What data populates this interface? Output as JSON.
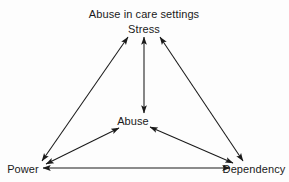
{
  "diagram": {
    "title": "Abuse in care settings",
    "type": "node-link-diagram",
    "background_color": "#fdfdfd",
    "line_color": "#1a1a1a",
    "text_color": "#1a1a1a",
    "nodes": [
      {
        "id": "stress",
        "label": "Stress",
        "x": 144,
        "y": 29,
        "role": "top-vertex"
      },
      {
        "id": "abuse",
        "label": "Abuse",
        "x": 133,
        "y": 121,
        "role": "center"
      },
      {
        "id": "power",
        "label": "Power",
        "x": 23,
        "y": 169,
        "role": "bottom-left-vertex"
      },
      {
        "id": "dependency",
        "label": "Dependency",
        "x": 254,
        "y": 169,
        "role": "bottom-right-vertex"
      }
    ],
    "edges": [
      {
        "id": "power-stress",
        "from": "power",
        "to": "stress",
        "arrows": "both"
      },
      {
        "id": "stress-dependency",
        "from": "stress",
        "to": "dependency",
        "arrows": "both"
      },
      {
        "id": "stress-abuse",
        "from": "stress",
        "to": "abuse",
        "arrows": "both"
      },
      {
        "id": "power-abuse",
        "from": "power",
        "to": "abuse",
        "arrows": "both"
      },
      {
        "id": "abuse-dependency",
        "from": "abuse",
        "to": "dependency",
        "arrows": "both"
      },
      {
        "id": "power-dependency",
        "from": "power",
        "to": "dependency",
        "arrows": "both"
      }
    ]
  }
}
